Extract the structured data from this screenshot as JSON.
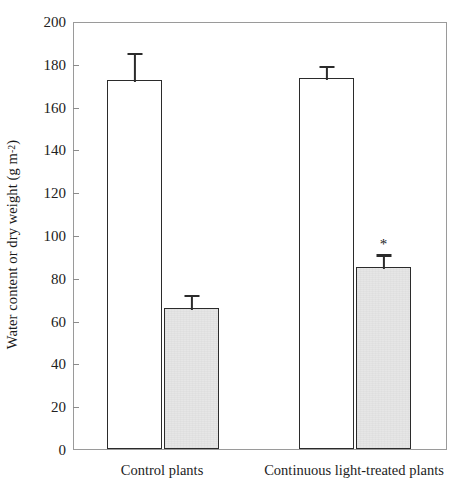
{
  "chart_data": {
    "type": "bar",
    "title": "",
    "xlabel": "",
    "ylabel": "Water content or dry weight (g m",
    "ylabel_exponent": "-2",
    "ylabel_suffix": ")",
    "categories": [
      "Control plants",
      "Continuous light-treated plants"
    ],
    "series": [
      {
        "name": "Water content",
        "style": "open",
        "values": [
          172.5,
          173.5
        ],
        "errors": [
          13.5,
          6.5
        ]
      },
      {
        "name": "Dry weight",
        "style": "filled",
        "values": [
          66.0,
          85.0
        ],
        "errors": [
          7.0,
          7.0
        ]
      }
    ],
    "ylim": [
      0,
      200
    ],
    "yticks": [
      0,
      20,
      40,
      60,
      80,
      100,
      120,
      140,
      160,
      180,
      200
    ],
    "ytick_labels": [
      "0",
      "20",
      "40",
      "60",
      "80",
      "100",
      "120",
      "140",
      "160",
      "180",
      "200"
    ],
    "grid": false,
    "legend": "none",
    "annotations": [
      {
        "text": "*",
        "category": "Continuous light-treated plants",
        "series": "Dry weight",
        "meaning": "significant-difference-marker"
      }
    ],
    "colors": {
      "open_bar_fill": "#ffffff",
      "filled_bar_fill": "#e6e6e6",
      "bar_edge": "#2b2b2b",
      "axis": "#9a9a9a",
      "text": "#1a1a1a"
    }
  }
}
